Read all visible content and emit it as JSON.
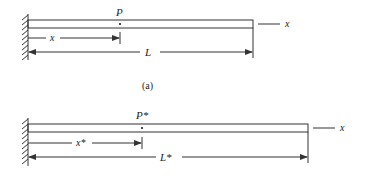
{
  "figure_a": {
    "point_label": "P",
    "position_label": "x",
    "length_label": "L",
    "axis_label": "x",
    "caption": "(a)"
  },
  "figure_b": {
    "point_label": "P*",
    "position_label": "x*",
    "length_label": "L*",
    "axis_label": "x"
  },
  "colors": {
    "line": "#333333",
    "background": "#ffffff"
  }
}
